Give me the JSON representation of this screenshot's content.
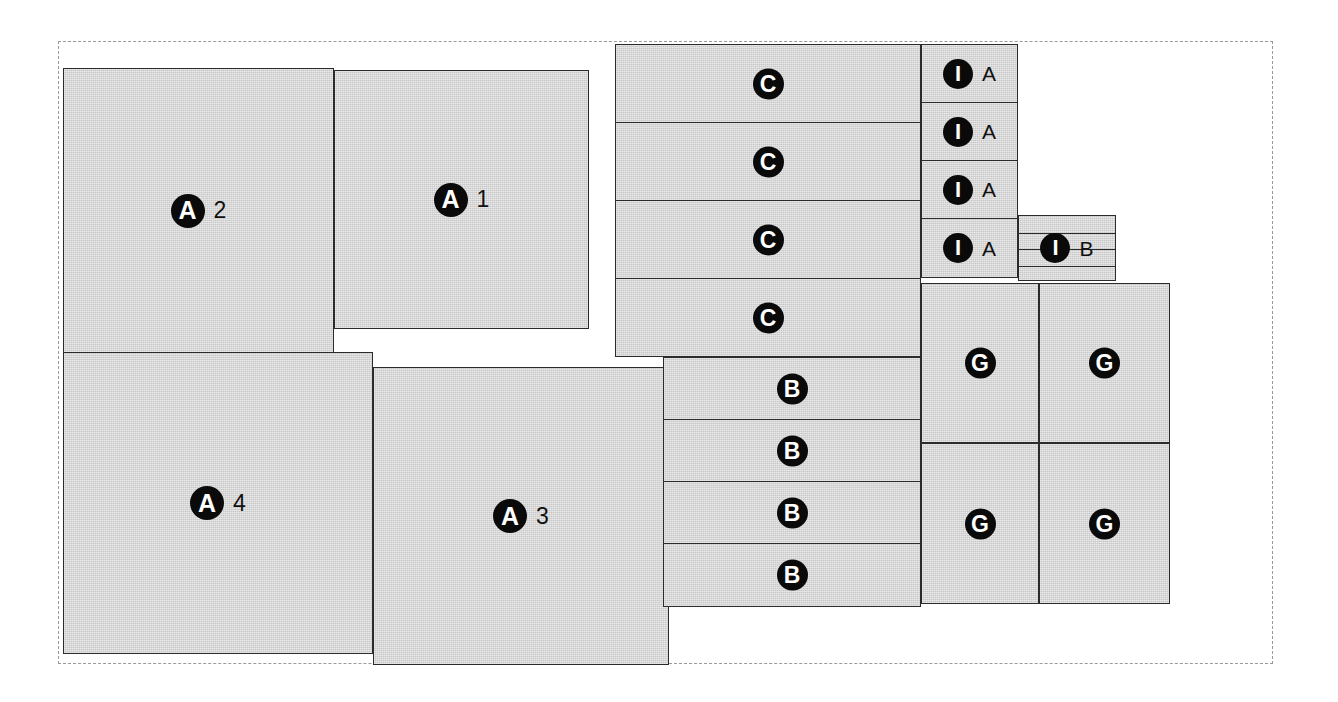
{
  "diagram": {
    "canvas": {
      "width": 1338,
      "height": 702
    },
    "colors": {
      "block_fill": "#c8c8c8",
      "block_stroke": "#2b2b2b",
      "badge_fill": "#0a0a0a",
      "badge_text": "#ffffff",
      "frame_stroke": "#9a9a9a",
      "background": "#ffffff"
    },
    "frame": {
      "x": 58,
      "y": 41,
      "width": 1215,
      "height": 623,
      "style": "dashed"
    },
    "blocks": [
      {
        "id": "a2",
        "badge": "A",
        "suffix": "2",
        "x": 63,
        "y": 68,
        "w": 271,
        "h": 285,
        "badge_size": "lg",
        "suffix_size": "big"
      },
      {
        "id": "a1",
        "badge": "A",
        "suffix": "1",
        "x": 334,
        "y": 70,
        "w": 255,
        "h": 259,
        "badge_size": "lg",
        "suffix_size": "big"
      },
      {
        "id": "a4",
        "badge": "A",
        "suffix": "4",
        "x": 63,
        "y": 352,
        "w": 310,
        "h": 302,
        "badge_size": "lg",
        "suffix_size": "big"
      },
      {
        "id": "a3",
        "badge": "A",
        "suffix": "3",
        "x": 373,
        "y": 367,
        "w": 296,
        "h": 298,
        "badge_size": "lg",
        "suffix_size": "big"
      },
      {
        "id": "c1",
        "badge": "C",
        "suffix": "",
        "x": 615,
        "y": 44,
        "w": 306,
        "h": 79,
        "badge_size": "md"
      },
      {
        "id": "c2",
        "badge": "C",
        "suffix": "",
        "x": 615,
        "y": 122,
        "w": 306,
        "h": 79,
        "badge_size": "md"
      },
      {
        "id": "c3",
        "badge": "C",
        "suffix": "",
        "x": 615,
        "y": 200,
        "w": 306,
        "h": 79,
        "badge_size": "md"
      },
      {
        "id": "c4",
        "badge": "C",
        "suffix": "",
        "x": 615,
        "y": 278,
        "w": 306,
        "h": 79,
        "badge_size": "md"
      },
      {
        "id": "b1",
        "badge": "B",
        "suffix": "",
        "x": 663,
        "y": 357,
        "w": 258,
        "h": 63,
        "badge_size": "md"
      },
      {
        "id": "b2",
        "badge": "B",
        "suffix": "",
        "x": 663,
        "y": 419,
        "w": 258,
        "h": 63,
        "badge_size": "md"
      },
      {
        "id": "b3",
        "badge": "B",
        "suffix": "",
        "x": 663,
        "y": 481,
        "w": 258,
        "h": 63,
        "badge_size": "md"
      },
      {
        "id": "b4",
        "badge": "B",
        "suffix": "",
        "x": 663,
        "y": 543,
        "w": 258,
        "h": 64,
        "badge_size": "md"
      },
      {
        "id": "ia1",
        "badge": "I",
        "suffix": "A",
        "x": 921,
        "y": 44,
        "w": 97,
        "h": 59,
        "badge_size": "sm"
      },
      {
        "id": "ia2",
        "badge": "I",
        "suffix": "A",
        "x": 921,
        "y": 102,
        "w": 97,
        "h": 59,
        "badge_size": "sm"
      },
      {
        "id": "ia3",
        "badge": "I",
        "suffix": "A",
        "x": 921,
        "y": 160,
        "w": 97,
        "h": 59,
        "badge_size": "sm"
      },
      {
        "id": "ia4",
        "badge": "I",
        "suffix": "A",
        "x": 921,
        "y": 218,
        "w": 97,
        "h": 60,
        "badge_size": "sm"
      },
      {
        "id": "ib1",
        "badge": "I",
        "suffix": "B",
        "x": 1018,
        "y": 215,
        "w": 98,
        "h": 66,
        "badge_size": "sm",
        "stripes": 3
      },
      {
        "id": "g1",
        "badge": "G",
        "suffix": "",
        "x": 921,
        "y": 283,
        "w": 118,
        "h": 160,
        "badge_size": "md"
      },
      {
        "id": "g2",
        "badge": "G",
        "suffix": "",
        "x": 1039,
        "y": 283,
        "w": 131,
        "h": 160,
        "badge_size": "md"
      },
      {
        "id": "g3",
        "badge": "G",
        "suffix": "",
        "x": 921,
        "y": 443,
        "w": 118,
        "h": 161,
        "badge_size": "md"
      },
      {
        "id": "g4",
        "badge": "G",
        "suffix": "",
        "x": 1039,
        "y": 443,
        "w": 131,
        "h": 161,
        "badge_size": "md"
      }
    ]
  }
}
